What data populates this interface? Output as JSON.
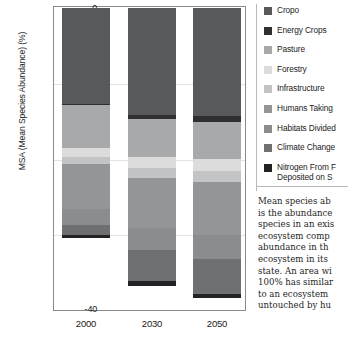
{
  "chart_data": {
    "type": "bar",
    "title": "",
    "xlabel": "",
    "ylabel": "MSA (Mean Species Abundance) (%)",
    "ylim": [
      -40,
      0
    ],
    "yticks": [
      0,
      -10,
      -20,
      -30,
      -40
    ],
    "ytick_labels": [
      "0",
      "-10",
      "-20",
      "-30",
      "-40"
    ],
    "categories": [
      "2000",
      "2030",
      "2050"
    ],
    "grid": true,
    "stacked": true,
    "orientation": "negative-down",
    "legend_position": "right",
    "series": [
      {
        "name": "Cropo",
        "color": "#58595b",
        "values": [
          -12.8,
          -14.2,
          -14.4
        ]
      },
      {
        "name": "Energy Crops",
        "color": "#2f2f31",
        "values": [
          -0.15,
          -0.55,
          -0.75
        ]
      },
      {
        "name": "Pasture",
        "color": "#a8a9ab",
        "values": [
          -5.6,
          -5.0,
          -4.9
        ]
      },
      {
        "name": "Forestry",
        "color": "#dcdcdd",
        "values": [
          -1.3,
          -1.5,
          -1.6
        ]
      },
      {
        "name": "Infrastructure",
        "color": "#c3c4c5",
        "values": [
          -0.9,
          -1.4,
          -1.5
        ]
      },
      {
        "name": "Humans Taking",
        "color": "#949597",
        "values": [
          -6.0,
          -6.6,
          -7.0
        ]
      },
      {
        "name": "Habitats Divided",
        "color": "#8b8c8e",
        "values": [
          -2.1,
          -2.9,
          -3.2
        ]
      },
      {
        "name": "Climate Change",
        "color": "#6e6f71",
        "values": [
          -1.3,
          -4.2,
          -4.6
        ]
      },
      {
        "name": "Nitrogen From F",
        "color": "#232325",
        "values": [
          -0.45,
          -0.6,
          -0.6
        ]
      }
    ]
  },
  "axis": {
    "y_title": "MSA (Mean Species Abundance) (%)",
    "y_ticks": [
      "0",
      "-10",
      "-20",
      "-30",
      "-40"
    ],
    "x_ticks": [
      "2000",
      "2030",
      "2050"
    ]
  },
  "legend": {
    "items": [
      {
        "label": "Cropo",
        "color": "#58595b"
      },
      {
        "label": "Energy Crops",
        "color": "#2f2f31"
      },
      {
        "label": "Pasture",
        "color": "#a8a9ab"
      },
      {
        "label": "Forestry",
        "color": "#dcdcdd"
      },
      {
        "label": "Infrastructure",
        "color": "#c3c4c5"
      },
      {
        "label": "Humans Taking",
        "color": "#949597"
      },
      {
        "label": "Habitats Divided",
        "color": "#8b8c8e"
      },
      {
        "label": "Climate Change",
        "color": "#6e6f71"
      },
      {
        "label": "Nitrogen From F",
        "label2": "Deposited  on S",
        "color": "#232325"
      }
    ]
  },
  "description": {
    "lines": [
      "Mean species ab",
      "is the abundance",
      "species in an exis",
      "ecosystem comp",
      "abundance in th",
      "ecosystem in its",
      "state. An area wi",
      "100% has similar",
      "to an ecosystem",
      "untouched by hu"
    ]
  }
}
